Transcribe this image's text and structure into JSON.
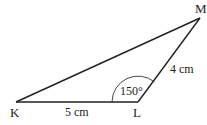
{
  "diagram": {
    "type": "triangle",
    "vertices": {
      "K": {
        "label": "K"
      },
      "L": {
        "label": "L"
      },
      "M": {
        "label": "M"
      }
    },
    "sides": {
      "KL": {
        "label": "5 cm"
      },
      "LM": {
        "label": "4 cm"
      }
    },
    "angles": {
      "KLM": {
        "label": "150°"
      }
    },
    "colors": {
      "stroke": "#222222",
      "background": "#ffffff"
    }
  }
}
